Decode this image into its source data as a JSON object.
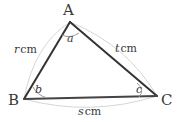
{
  "figure": {
    "type": "triangle-diagram",
    "background_color": "#ffffff",
    "stroke_color": "#333333",
    "arc_color": "#d0d0d0",
    "angle_arc_color": "#9a9a9a",
    "vertices": {
      "A": {
        "label": "A",
        "x": 70,
        "y": 22
      },
      "B": {
        "label": "B",
        "x": 24,
        "y": 99
      },
      "C": {
        "label": "C",
        "x": 157,
        "y": 96
      }
    },
    "angles": {
      "a": {
        "label": "a",
        "at_vertex": "A"
      },
      "b": {
        "label": "b",
        "at_vertex": "B"
      },
      "c": {
        "label": "c",
        "at_vertex": "C"
      }
    },
    "sides": {
      "AB": {
        "variable": "r",
        "unit": "cm"
      },
      "AC": {
        "variable": "t",
        "unit": "cm"
      },
      "BC": {
        "variable": "s",
        "unit": "cm"
      }
    }
  }
}
